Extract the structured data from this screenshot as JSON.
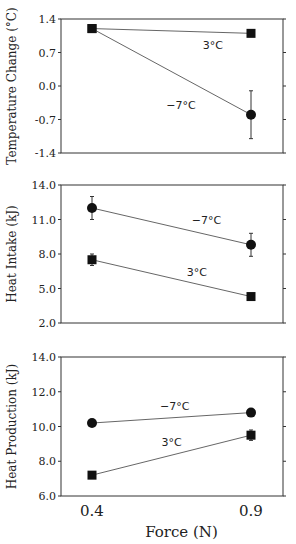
{
  "chart_data": [
    {
      "type": "line",
      "panel": "top",
      "title": "",
      "xlabel": "",
      "ylabel": "Temperature Change (°C)",
      "x": [
        0.4,
        0.9
      ],
      "ylim": [
        -1.4,
        1.4
      ],
      "yticks": [
        1.4,
        0.7,
        0.0,
        -0.7,
        -1.4
      ],
      "ytick_labels": [
        "1.4",
        "0.7",
        "0.0",
        "-0.7",
        "-1.4"
      ],
      "grid": false,
      "series": [
        {
          "name": "3°C",
          "marker": "square",
          "values": [
            1.2,
            1.1
          ],
          "error": [
            null,
            null
          ]
        },
        {
          "name": "-7°C",
          "marker": "square-then-circle",
          "values": [
            1.2,
            -0.6
          ],
          "error": [
            null,
            0.5
          ]
        }
      ],
      "annotations": [
        {
          "text": "3°C",
          "x": 0.78,
          "y": 0.85
        },
        {
          "text": "−7°C",
          "x": 0.68,
          "y": -0.4
        }
      ]
    },
    {
      "type": "line",
      "panel": "middle",
      "title": "",
      "xlabel": "",
      "ylabel": "Heat Intake (kJ)",
      "x": [
        0.4,
        0.9
      ],
      "ylim": [
        2.0,
        14.0
      ],
      "yticks": [
        14.0,
        11.0,
        8.0,
        5.0,
        2.0
      ],
      "ytick_labels": [
        "14.0",
        "11.0",
        "8.0",
        "5.0",
        "2.0"
      ],
      "grid": false,
      "series": [
        {
          "name": "-7°C",
          "marker": "circle",
          "values": [
            12.0,
            8.8
          ],
          "error": [
            1.0,
            1.0
          ]
        },
        {
          "name": "3°C",
          "marker": "square",
          "values": [
            7.5,
            4.3
          ],
          "error": [
            0.5,
            null
          ]
        }
      ],
      "annotations": [
        {
          "text": "−7°C",
          "x": 0.76,
          "y": 11.0
        },
        {
          "text": "3°C",
          "x": 0.73,
          "y": 6.4
        }
      ]
    },
    {
      "type": "line",
      "panel": "bottom",
      "title": "",
      "xlabel": "Force (N)",
      "ylabel": "Heat Production (kJ)",
      "x": [
        0.4,
        0.9
      ],
      "xtick_labels": [
        "0.4",
        "0.9"
      ],
      "ylim": [
        6.0,
        14.0
      ],
      "yticks": [
        14.0,
        12.0,
        10.0,
        8.0,
        6.0
      ],
      "ytick_labels": [
        "14.0",
        "12.0",
        "10.0",
        "8.0",
        "6.0"
      ],
      "grid": false,
      "series": [
        {
          "name": "-7°C",
          "marker": "circle",
          "values": [
            10.2,
            10.8
          ],
          "error": [
            null,
            null
          ]
        },
        {
          "name": "3°C",
          "marker": "square",
          "values": [
            7.2,
            9.5
          ],
          "error": [
            null,
            0.3
          ]
        }
      ],
      "annotations": [
        {
          "text": "−7°C",
          "x": 0.66,
          "y": 11.2
        },
        {
          "text": "3°C",
          "x": 0.65,
          "y": 9.1
        }
      ]
    }
  ],
  "layout": {
    "x_pixel": {
      "0.4": 92,
      "0.9": 251
    },
    "plot_left": 61,
    "plot_right": 283,
    "panels_px": [
      {
        "top": 19,
        "bottom": 153
      },
      {
        "top": 185,
        "bottom": 323
      },
      {
        "top": 357,
        "bottom": 496
      }
    ]
  }
}
